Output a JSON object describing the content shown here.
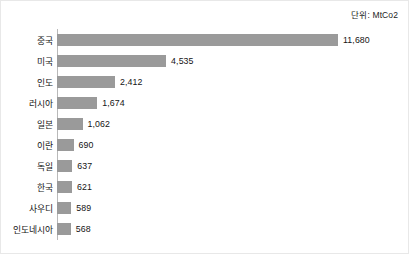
{
  "unit_note": "단위: MtCo2",
  "axis": {
    "bar_color": "#9a9a9a",
    "axis_line_color": "#b9b9b9",
    "frame_color": "#e8e8e8"
  },
  "chart_data": {
    "type": "bar",
    "orientation": "horizontal",
    "title": "",
    "subtitle": "",
    "xlabel": "",
    "ylabel": "",
    "unit": "MtCo2",
    "unit_note": "단위: MtCo2",
    "grid": false,
    "legend": false,
    "legend_position": "none",
    "xlim": [
      0,
      11680
    ],
    "categories": [
      "중국",
      "미국",
      "인도",
      "러시아",
      "일본",
      "이란",
      "독일",
      "한국",
      "사우디",
      "인도네시아"
    ],
    "values": [
      11680,
      4535,
      2412,
      1674,
      1062,
      690,
      637,
      621,
      589,
      568
    ],
    "value_labels": [
      "11,680",
      "4,535",
      "2,412",
      "1,674",
      "1,062",
      "690",
      "637",
      "621",
      "589",
      "568"
    ],
    "rows": [
      {
        "label": "중국",
        "value": 11680,
        "value_label": "11,680"
      },
      {
        "label": "미국",
        "value": 4535,
        "value_label": "4,535"
      },
      {
        "label": "인도",
        "value": 2412,
        "value_label": "2,412"
      },
      {
        "label": "러시아",
        "value": 1674,
        "value_label": "1,674"
      },
      {
        "label": "일본",
        "value": 1062,
        "value_label": "1,062"
      },
      {
        "label": "이란",
        "value": 690,
        "value_label": "690"
      },
      {
        "label": "독일",
        "value": 637,
        "value_label": "637"
      },
      {
        "label": "한국",
        "value": 621,
        "value_label": "621"
      },
      {
        "label": "사우디",
        "value": 589,
        "value_label": "589"
      },
      {
        "label": "인도네시아",
        "value": 568,
        "value_label": "568"
      }
    ]
  }
}
